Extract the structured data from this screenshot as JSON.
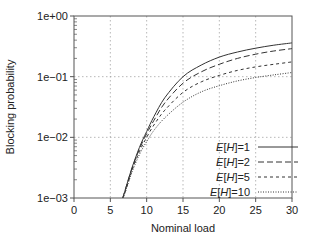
{
  "chart_data": {
    "type": "line",
    "title": "",
    "xlabel": "Nominal load",
    "ylabel": "Blocking probability",
    "xlim": [
      0,
      30
    ],
    "ylim": [
      0.001,
      1
    ],
    "yscale": "log",
    "xticks": [
      0,
      5,
      10,
      15,
      20,
      25,
      30
    ],
    "xtick_labels": [
      "0",
      "5",
      "10",
      "15",
      "20",
      "25",
      "30"
    ],
    "yticks": [
      1,
      0.1,
      0.01,
      0.001
    ],
    "ytick_labels": [
      "1e+00",
      "1e−01",
      "1e−02",
      "1e−03"
    ],
    "grid": true,
    "legend_position": "lower right",
    "x": [
      6.7,
      7,
      8,
      9,
      10,
      11,
      12.5,
      15,
      17.5,
      20,
      22.5,
      25,
      27.5,
      30
    ],
    "series": [
      {
        "name": "E[H]=1",
        "style": "solid",
        "values": [
          0.001,
          0.0013,
          0.0032,
          0.0068,
          0.0125,
          0.022,
          0.045,
          0.1,
          0.155,
          0.21,
          0.255,
          0.295,
          0.33,
          0.36
        ]
      },
      {
        "name": "E[H]=2",
        "style": "dashed",
        "values": [
          0.001,
          0.0013,
          0.0031,
          0.0064,
          0.0115,
          0.019,
          0.037,
          0.078,
          0.12,
          0.16,
          0.2,
          0.235,
          0.265,
          0.29
        ]
      },
      {
        "name": "E[H]=5",
        "style": "short-dashed",
        "values": [
          0.001,
          0.0012,
          0.0029,
          0.0058,
          0.01,
          0.016,
          0.028,
          0.055,
          0.082,
          0.105,
          0.127,
          0.145,
          0.16,
          0.175
        ]
      },
      {
        "name": "E[H]=10",
        "style": "dotted",
        "values": [
          0.001,
          0.0012,
          0.0027,
          0.0052,
          0.0085,
          0.013,
          0.021,
          0.038,
          0.056,
          0.071,
          0.085,
          0.097,
          0.107,
          0.117
        ]
      }
    ]
  },
  "legend": {
    "items": [
      {
        "prefix": "E[",
        "var": "H",
        "suffix": "]=1",
        "dash": ""
      },
      {
        "prefix": "E[",
        "var": "H",
        "suffix": "]=2",
        "dash": "6,3"
      },
      {
        "prefix": "E[",
        "var": "H",
        "suffix": "]=5",
        "dash": "3,3"
      },
      {
        "prefix": "E[",
        "var": "H",
        "suffix": "]=10",
        "dash": "1,1.5"
      }
    ]
  },
  "colors": {
    "line": "#333333",
    "grid": "#999999",
    "axis": "#555555"
  }
}
